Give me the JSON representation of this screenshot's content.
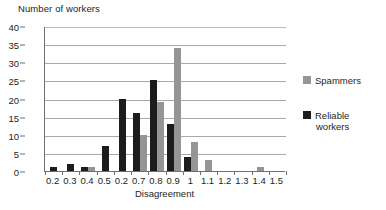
{
  "chart_data": {
    "type": "bar",
    "title": "",
    "ylabel": "Number of workers",
    "xlabel": "Disagreement",
    "categories": [
      "0.2",
      "0.3",
      "0.4",
      "0.5",
      "0.2",
      "0.7",
      "0.8",
      "0.9",
      "1",
      "1.1",
      "1.2",
      "1.3",
      "1.4",
      "1.5"
    ],
    "series": [
      {
        "name": "Spammers",
        "color": "#959595",
        "values": [
          0,
          0,
          1,
          0,
          0,
          10,
          19,
          34,
          8,
          3,
          0,
          0,
          1,
          0
        ]
      },
      {
        "name": "Reliable workers",
        "color": "#1c1c1c",
        "values": [
          1,
          2,
          1,
          7,
          20,
          16,
          25,
          13,
          4,
          0,
          0,
          0,
          0,
          0
        ]
      }
    ],
    "ylim": [
      0,
      40
    ],
    "ytick_labels": [
      "0",
      "5",
      "10",
      "15",
      "20",
      "25",
      "30",
      "35",
      "40"
    ],
    "ytick_values": [
      0,
      5,
      10,
      15,
      20,
      25,
      30,
      35,
      40
    ],
    "grid": "horizontal",
    "legend_position": "right"
  },
  "legend": {
    "entries": [
      {
        "label": "Spammers",
        "label_line1": "Spammers",
        "label_line2": ""
      },
      {
        "label": "Reliable workers",
        "label_line1": "Reliable",
        "label_line2": "workers"
      }
    ]
  },
  "axes": {
    "y_title": "Number of workers",
    "x_title": "Disagreement"
  }
}
